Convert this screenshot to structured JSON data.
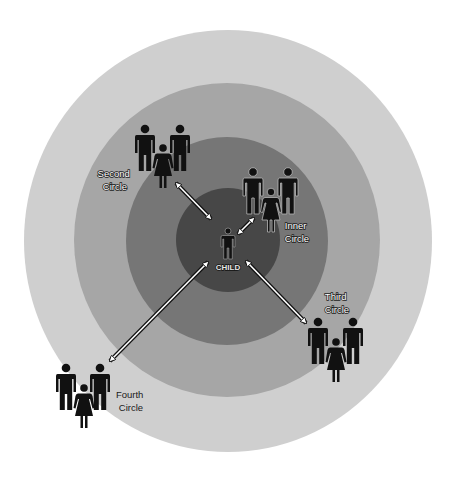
{
  "diagram": {
    "type": "concentric-circles",
    "center": {
      "x": 228,
      "y": 241
    },
    "rings": [
      {
        "name": "Fourth Circle",
        "rx": 204,
        "ry": 211,
        "color": "#cfcfcf"
      },
      {
        "name": "Third Circle",
        "rx": 153,
        "ry": 157,
        "color": "#a6a6a6"
      },
      {
        "name": "Second Circle",
        "rx": 101,
        "ry": 104,
        "color": "#767676"
      },
      {
        "name": "Inner Circle",
        "rx": 52,
        "ry": 52,
        "color": "#474747"
      }
    ],
    "center_label": "CHILD",
    "labels": {
      "second": [
        "Second",
        "Circle"
      ],
      "inner": [
        "Inner",
        "Circle"
      ],
      "third": [
        "Third",
        "Circle"
      ],
      "fourth": [
        "Fourth",
        "Circle"
      ]
    },
    "groups": [
      {
        "name": "second-circle-group",
        "members": [
          "man",
          "woman",
          "man"
        ]
      },
      {
        "name": "inner-circle-group",
        "members": [
          "man",
          "woman",
          "man"
        ]
      },
      {
        "name": "third-circle-group",
        "members": [
          "man",
          "woman",
          "man"
        ]
      },
      {
        "name": "fourth-circle-group",
        "members": [
          "man",
          "woman",
          "man"
        ]
      }
    ],
    "arrows": [
      {
        "from": "child",
        "to": "Second Circle",
        "style": "double-headed"
      },
      {
        "from": "child",
        "to": "Inner Circle",
        "style": "double-headed"
      },
      {
        "from": "child",
        "to": "Third Circle",
        "style": "double-headed"
      },
      {
        "from": "child",
        "to": "Fourth Circle",
        "style": "double-headed"
      }
    ]
  }
}
